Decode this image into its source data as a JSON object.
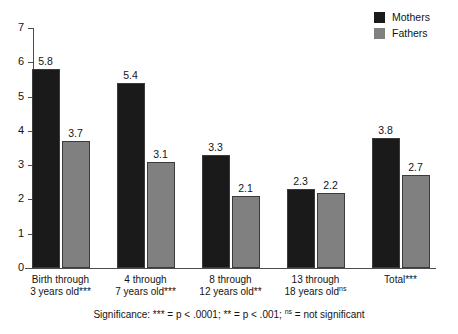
{
  "chart_data": {
    "type": "bar",
    "title": "",
    "xlabel": "",
    "ylabel": "",
    "ylim": [
      0,
      7
    ],
    "yticks": [
      0,
      1,
      2,
      3,
      4,
      5,
      6,
      7
    ],
    "grid": false,
    "legend_position": "top-right",
    "categories": [
      "Birth through 3 years old***",
      "4 through 7 years old***",
      "8 through 12 years old**",
      "13 through 18 years old<ns>",
      "Total***"
    ],
    "category_lines": [
      [
        "Birth through",
        "3 years old***"
      ],
      [
        "4 through",
        "7 years old***"
      ],
      [
        "8 through",
        "12 years old**"
      ],
      [
        "13 through",
        "18 years old",
        "ns"
      ],
      [
        "Total***"
      ]
    ],
    "series": [
      {
        "name": "Mothers",
        "color": "#1a1a1a",
        "values": [
          5.8,
          5.4,
          3.3,
          2.3,
          3.8
        ],
        "labels": [
          "5.8",
          "5.4",
          "3.3",
          "2.3",
          "3.8"
        ]
      },
      {
        "name": "Fathers",
        "color": "#808080",
        "values": [
          3.7,
          3.1,
          2.1,
          2.2,
          2.7
        ],
        "labels": [
          "3.7",
          "3.1",
          "2.1",
          "2.2",
          "2.7"
        ]
      }
    ],
    "annotations": [
      "Significance: *** = p < .0001; ** = p < .001; ns = not significant"
    ]
  },
  "legend": {
    "items": [
      {
        "label": "Mothers",
        "color": "#1a1a1a"
      },
      {
        "label": "Fathers",
        "color": "#808080"
      }
    ]
  },
  "axis": {
    "y_tick_labels": [
      "7",
      "6",
      "5",
      "4",
      "3",
      "2",
      "1",
      "0"
    ]
  },
  "footnote": {
    "prefix": "Significance: *** = p < .0001; ** = p < .001; ",
    "sup": "ns",
    "suffix": " = not significant"
  }
}
